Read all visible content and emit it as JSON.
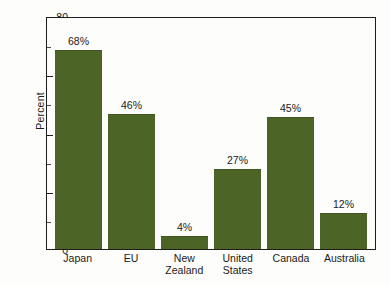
{
  "chart_data": {
    "type": "bar",
    "title": "",
    "xlabel": "",
    "ylabel": "Percent",
    "categories": [
      "Japan",
      "EU",
      "New Zealand",
      "United States",
      "Canada",
      "Australia"
    ],
    "category_lines": [
      [
        "Japan"
      ],
      [
        "EU"
      ],
      [
        "New",
        "Zealand"
      ],
      [
        "United",
        "States"
      ],
      [
        "Canada"
      ],
      [
        "Australia"
      ]
    ],
    "values": [
      68,
      46,
      4,
      27,
      45,
      12
    ],
    "value_labels": [
      "68%",
      "46%",
      "4%",
      "27%",
      "45%",
      "12%"
    ],
    "ylim": [
      0,
      80
    ],
    "y_major_ticks": [
      0,
      20,
      40,
      60,
      80
    ],
    "y_major_tick_labels": [
      "0",
      "20",
      "40",
      "60",
      "80"
    ],
    "y_minor_ticks": [
      10,
      30,
      50,
      70
    ],
    "grid": false,
    "legend": false,
    "legend_position": "none",
    "bar_color": "#4c6526",
    "axis_color": "#1d1d1d",
    "background_color": "#fdfdfb"
  }
}
